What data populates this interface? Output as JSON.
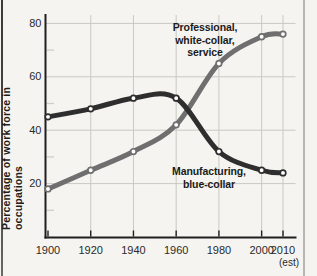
{
  "figure": {
    "kind": "scanned textbook line chart",
    "background": "#f5f4f0",
    "page_edge_left_color": "#45433f",
    "page_edge_right_color": "#b8b6b0"
  },
  "chart_data": {
    "type": "line",
    "title": "",
    "xlabel": "",
    "ylabel": "Percentage of work force in occupations",
    "x_categories": [
      "1900",
      "1920",
      "1940",
      "1960",
      "1980",
      "2000",
      "2010"
    ],
    "x_numeric": [
      1900,
      1920,
      1940,
      1960,
      1980,
      2000,
      2010
    ],
    "x_last_note": "(est)",
    "ylim": [
      0,
      85
    ],
    "xlim": [
      1900,
      2010
    ],
    "yticks": [
      20,
      40,
      60,
      80
    ],
    "y_minor_ticks": [
      10,
      30,
      50,
      70
    ],
    "grid": true,
    "legend_position": "inline-annotations",
    "series": [
      {
        "name": "Professional, white-collar, service",
        "label_lines": "Professional,\nwhite-collar,\nservice",
        "color": "#6f6f6f",
        "values": [
          18,
          25,
          32,
          42,
          65,
          75,
          76
        ]
      },
      {
        "name": "Manufacturing, blue-collar",
        "label_lines": "Manufacturing,\nblue-collar",
        "color": "#2e2e2e",
        "values": [
          45,
          48,
          52,
          52,
          32,
          25,
          24
        ]
      }
    ],
    "point_style": {
      "fill": "#ffffff",
      "radius": 2.8
    },
    "colors": {
      "axis": "#1f1f1f",
      "grid": "#c9c8c3",
      "minor_tick": "#cfcec8",
      "tick_label": "#2a2a2a"
    }
  }
}
